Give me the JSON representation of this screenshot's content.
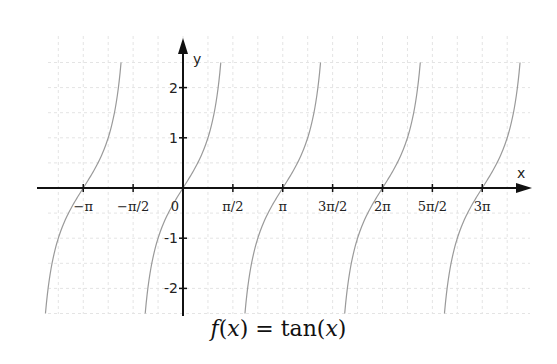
{
  "chart_data": {
    "type": "line",
    "title": "f(x) = tan(x)",
    "xlabel": "x",
    "ylabel": "y",
    "function": "tan(x)",
    "xlim": [
      -4.2,
      11.0
    ],
    "ylim": [
      -2.5,
      2.5
    ],
    "grid": true,
    "legend": null,
    "x_ticks": [
      {
        "value": -3.14159,
        "label": "−π"
      },
      {
        "value": -1.5708,
        "label": "−π/2"
      },
      {
        "value": 0,
        "label": "0"
      },
      {
        "value": 1.5708,
        "label": "π/2"
      },
      {
        "value": 3.14159,
        "label": "π"
      },
      {
        "value": 4.71239,
        "label": "3π/2"
      },
      {
        "value": 6.28319,
        "label": "2π"
      },
      {
        "value": 7.85398,
        "label": "5π/2"
      },
      {
        "value": 9.42478,
        "label": "3π"
      }
    ],
    "y_ticks": [
      {
        "value": 2,
        "label": "2"
      },
      {
        "value": 1,
        "label": "1"
      },
      {
        "value": -1,
        "label": "-1"
      },
      {
        "value": -2,
        "label": "-2"
      }
    ],
    "series": [
      {
        "name": "tan(x)",
        "color": "#9a9a9a",
        "branches_centered_at": [
          -3.14159,
          0,
          3.14159,
          6.28319,
          9.42478
        ],
        "zeros_x": [
          -3.14159,
          0,
          3.14159,
          6.28319,
          9.42478
        ]
      }
    ],
    "pixel_mapping": {
      "origin_px": [
        183,
        188
      ],
      "px_per_pi": 99.75,
      "px_per_unit_y": 50.2
    }
  },
  "caption": {
    "prefix": "f",
    "open1": "(",
    "var1": "x",
    "close1": ")",
    "eq": " = tan(",
    "var2": "x",
    "close2": ")"
  }
}
